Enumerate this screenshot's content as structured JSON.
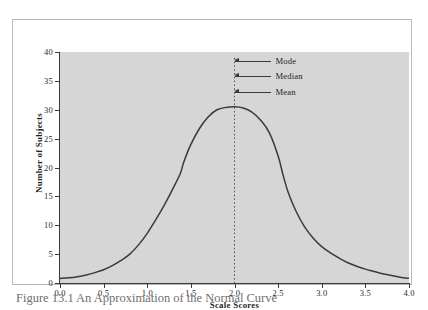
{
  "figure": {
    "caption": "Figure 13.1 An Approximation of the Normal Curve",
    "plot_background_color": "#d6d6d6",
    "curve_color": "#3a3a3a",
    "axis_color": "#3a3a3a",
    "frame_color": "#b9b9b9"
  },
  "chart_data": {
    "type": "line",
    "title": "",
    "subtitle": "",
    "xlabel": "Scale Scores",
    "ylabel": "Number of Subjects",
    "xlim": [
      0,
      4
    ],
    "ylim": [
      0,
      40
    ],
    "grid": false,
    "legend_position": "none",
    "xticks": [
      "0.0",
      "0.5",
      "1.0",
      "1.5",
      "2.0",
      "2.5",
      "3.0",
      "3.5",
      "4.0"
    ],
    "xtick_values": [
      0,
      0.5,
      1,
      1.5,
      2,
      2.5,
      3,
      3.5,
      4
    ],
    "yticks": [
      "0",
      "5",
      "10",
      "15",
      "20",
      "25",
      "30",
      "35",
      "40"
    ],
    "ytick_values": [
      0,
      5,
      10,
      15,
      20,
      25,
      30,
      35,
      40
    ],
    "series": [
      {
        "name": "Normal curve approximation",
        "x": [
          0.0,
          0.1,
          0.2,
          0.3,
          0.4,
          0.5,
          0.6,
          0.7,
          0.8,
          0.9,
          1.0,
          1.1,
          1.2,
          1.3,
          1.38,
          1.42,
          1.5,
          1.6,
          1.7,
          1.8,
          1.9,
          2.0,
          2.1,
          2.2,
          2.3,
          2.4,
          2.5,
          2.56,
          2.62,
          2.7,
          2.8,
          2.9,
          3.0,
          3.1,
          3.2,
          3.3,
          3.4,
          3.5,
          3.6,
          3.7,
          3.8,
          3.9,
          4.0
        ],
        "y": [
          0.8,
          0.9,
          1.1,
          1.4,
          1.8,
          2.3,
          3.0,
          3.9,
          5.0,
          6.6,
          8.6,
          11.0,
          13.6,
          16.5,
          19.0,
          21.0,
          24.0,
          26.8,
          28.8,
          30.0,
          30.4,
          30.5,
          30.3,
          29.6,
          28.2,
          26.0,
          22.0,
          18.5,
          15.5,
          12.6,
          9.8,
          7.8,
          6.3,
          5.2,
          4.3,
          3.5,
          2.9,
          2.4,
          2.0,
          1.6,
          1.3,
          1.0,
          0.8
        ]
      }
    ],
    "reference_line": {
      "label": "center line at scale score 2.0",
      "x": 2.0,
      "y_from": 0,
      "y_to": 39,
      "style": "dashed"
    },
    "annotations": [
      {
        "label": "Mode",
        "x": 2.0,
        "y": 38.4
      },
      {
        "label": "Median",
        "x": 2.0,
        "y": 35.8
      },
      {
        "label": "Mean",
        "x": 2.0,
        "y": 33.0
      }
    ]
  }
}
